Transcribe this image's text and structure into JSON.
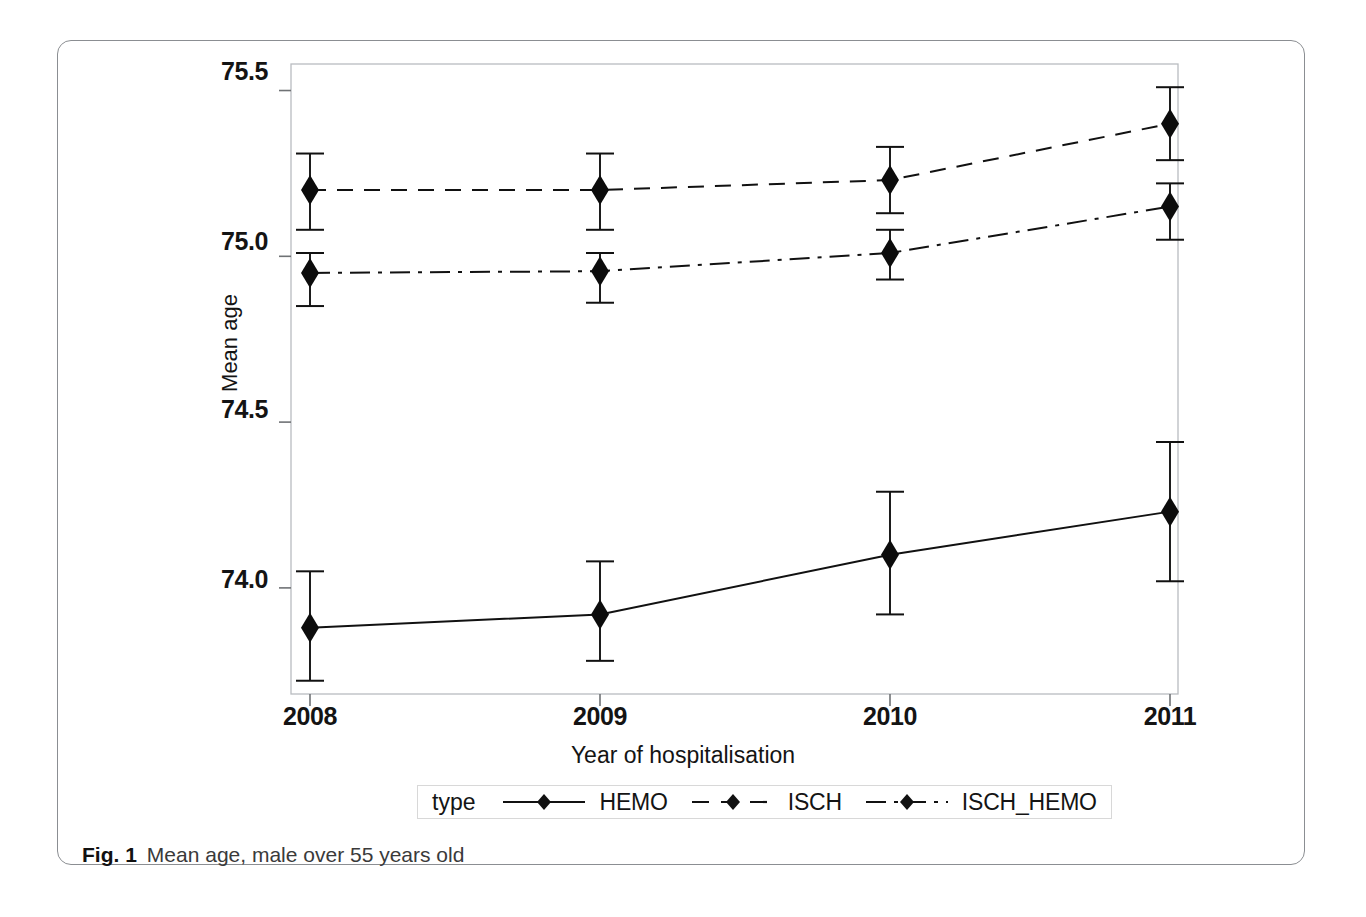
{
  "figure": {
    "caption_label": "Fig. 1",
    "caption_text": "Mean age, male over 55 years old"
  },
  "legend": {
    "title": "type",
    "entries": [
      {
        "label": "HEMO",
        "style": "solid",
        "marker": "diamond"
      },
      {
        "label": "ISCH",
        "style": "dashed",
        "marker": "diamond"
      },
      {
        "label": "ISCH_HEMO",
        "style": "dash-dot",
        "marker": "diamond"
      }
    ]
  },
  "axes": {
    "x_title": "Year of hospitalisation",
    "y_title": "Mean age",
    "y_ticks": [
      "75.5",
      "75.0",
      "74.5",
      "74.0"
    ],
    "x_ticks": [
      "2008",
      "2009",
      "2010",
      "2011"
    ]
  },
  "chart_data": {
    "type": "line",
    "title": "Mean age, male over 55 years old",
    "xlabel": "Year of hospitalisation",
    "ylabel": "Mean age",
    "x": [
      "2008",
      "2009",
      "2010",
      "2011"
    ],
    "ylim": [
      73.68,
      75.58
    ],
    "yticks": [
      74.0,
      74.5,
      75.0,
      75.5
    ],
    "grid": false,
    "legend_position": "bottom",
    "error_bars": "95% confidence interval",
    "series": [
      {
        "name": "HEMO",
        "linestyle": "solid",
        "marker": "diamond",
        "color": "#111111",
        "values": [
          73.88,
          73.92,
          74.1,
          74.23
        ],
        "ci_lower": [
          73.72,
          73.78,
          73.92,
          74.02
        ],
        "ci_upper": [
          74.05,
          74.08,
          74.29,
          74.44
        ]
      },
      {
        "name": "ISCH",
        "linestyle": "dashed",
        "marker": "diamond",
        "color": "#111111",
        "values": [
          75.2,
          75.2,
          75.23,
          75.4
        ],
        "ci_lower": [
          75.08,
          75.08,
          75.13,
          75.29
        ],
        "ci_upper": [
          75.31,
          75.31,
          75.33,
          75.51
        ]
      },
      {
        "name": "ISCH_HEMO",
        "linestyle": "dash-dot",
        "marker": "diamond",
        "color": "#111111",
        "values": [
          74.95,
          74.955,
          75.01,
          75.15
        ],
        "ci_lower": [
          74.85,
          74.86,
          74.93,
          75.05
        ],
        "ci_upper": [
          75.01,
          75.01,
          75.08,
          75.22
        ]
      }
    ]
  }
}
